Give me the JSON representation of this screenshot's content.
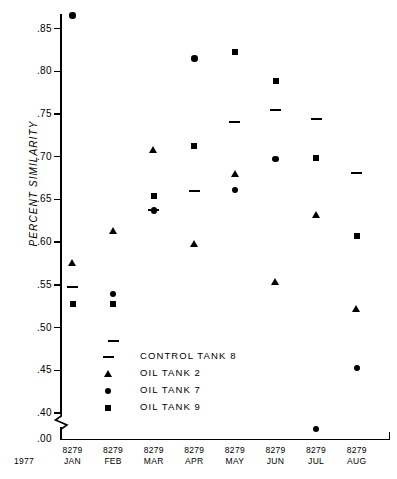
{
  "header": {
    "running_title": "",
    "page_number": ""
  },
  "axes": {
    "ylabel": "PERCENT SIMILARITY",
    "year": "1977",
    "origin_label": ".00"
  },
  "legend": {
    "items": [
      {
        "symbol": "dash",
        "label": "CONTROL TANK 8"
      },
      {
        "symbol": "triangle",
        "label": "OIL TANK 2"
      },
      {
        "symbol": "circle",
        "label": "OIL TANK 7"
      },
      {
        "symbol": "square",
        "label": "OIL TANK 9"
      }
    ]
  },
  "chart_data": {
    "type": "scatter",
    "title": "",
    "xlabel": "",
    "ylabel": "PERCENT SIMILARITY",
    "categories": [
      "JAN",
      "FEB",
      "MAR",
      "APR",
      "MAY",
      "JUN",
      "JUL",
      "AUG"
    ],
    "category_codes": [
      "8279",
      "8279",
      "8279",
      "8279",
      "8279",
      "8279",
      "8279",
      "8279"
    ],
    "year": "1977",
    "ylim": [
      0.4,
      0.87
    ],
    "yticks": [
      0.4,
      0.45,
      0.5,
      0.55,
      0.6,
      0.65,
      0.7,
      0.75,
      0.8,
      0.85
    ],
    "ytick_labels": [
      ".40",
      ".45",
      ".50",
      ".55",
      ".60",
      ".65",
      ".70",
      ".75",
      ".80",
      ".85"
    ],
    "axis_break": true,
    "axis_break_label": ".00",
    "grid": false,
    "legend_position": "inside-lower-left",
    "series": [
      {
        "name": "CONTROL TANK 8",
        "symbol": "dash",
        "values": [
          0.547,
          0.484,
          0.638,
          0.66,
          0.741,
          0.755,
          0.744,
          0.681
        ]
      },
      {
        "name": "OIL TANK 2",
        "symbol": "triangle",
        "values": [
          0.575,
          0.613,
          0.707,
          0.598,
          0.679,
          0.553,
          0.631,
          0.521
        ]
      },
      {
        "name": "OIL TANK 7",
        "symbol": "circle",
        "values": [
          0.865,
          0.539,
          0.637,
          0.815,
          0.661,
          0.697,
          0.381,
          0.453
        ]
      },
      {
        "name": "OIL TANK 9",
        "symbol": "square",
        "values": [
          0.528,
          0.527,
          0.654,
          0.713,
          0.823,
          0.789,
          0.699,
          0.607
        ]
      }
    ]
  }
}
